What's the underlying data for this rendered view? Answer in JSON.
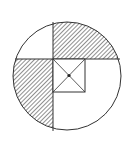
{
  "diagram": {
    "colors": {
      "stroke": "#333333",
      "hatch": "#444444",
      "background": "#ffffff"
    },
    "circle": {
      "cx": 67,
      "cy": 76,
      "r": 54
    },
    "vertical_line_x": 53,
    "horizontal_line_y": 59,
    "square": {
      "x": 53,
      "y": 59,
      "size": 32
    },
    "center_dot": {
      "cx": 69,
      "cy": 75
    }
  }
}
